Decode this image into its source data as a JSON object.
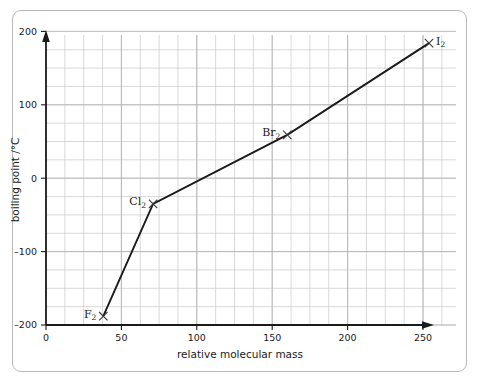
{
  "chart_data": {
    "type": "line",
    "title": "",
    "xlabel": "relative molecular mass",
    "ylabel": "boiling point /°C",
    "xlim": [
      0,
      272
    ],
    "ylim": [
      -200,
      200
    ],
    "xticks": [
      0,
      50,
      100,
      150,
      200,
      250
    ],
    "xticklabels": [
      "0",
      "50",
      "100",
      "150",
      "200",
      "250"
    ],
    "yticks": [
      -200,
      -100,
      0,
      100,
      200
    ],
    "yticklabels": [
      "–200",
      "–100",
      "0",
      "100",
      "200"
    ],
    "grid": true,
    "grid_minor_step_x": 12.5,
    "grid_minor_step_y": 25,
    "legend": "none",
    "marker": "x",
    "series": [
      {
        "name": "halogen boiling points",
        "points": [
          {
            "label": "F₂",
            "label_base": "F",
            "label_sub": "2",
            "x": 38,
            "y": -188
          },
          {
            "label": "Cl₂",
            "label_base": "Cl",
            "label_sub": "2",
            "x": 71,
            "y": -35
          },
          {
            "label": "Br₂",
            "label_base": "Br",
            "label_sub": "2",
            "x": 160,
            "y": 59
          },
          {
            "label": "I₂",
            "label_base": "I",
            "label_sub": "2",
            "x": 254,
            "y": 184
          }
        ]
      }
    ]
  },
  "axes": {
    "x_axis_name": "relative molecular mass",
    "y_axis_name": "boiling point /°C"
  },
  "colors": {
    "line": "#1a1a1a",
    "grid": "#c9c9c9",
    "axis": "#1a1a1a",
    "border": "#b9b9b9",
    "background": "#ffffff"
  }
}
